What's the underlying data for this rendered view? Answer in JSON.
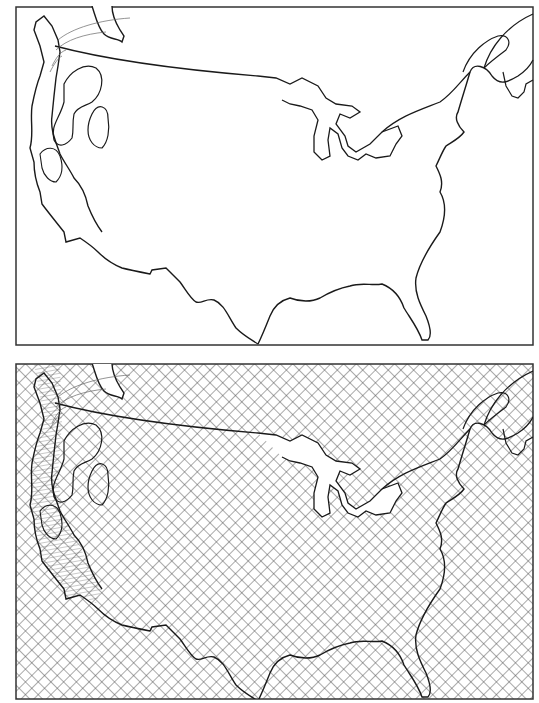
{
  "figure": {
    "type": "paired maps",
    "region": "contiguous United States and southern Canada",
    "line_color": "#1a1a1a",
    "frame_color": "#333333",
    "background": "#ffffff",
    "hatch_color": "#555555"
  },
  "panels": [
    {
      "id": "top",
      "fill": "none",
      "features": [
        "coastline",
        "US-Canada border",
        "Great Lakes",
        "Hudson Bay edge",
        "Gulf of St. Lawrence",
        "western contour regions with tick marks"
      ]
    },
    {
      "id": "bottom",
      "fill": "cross-hatched",
      "features": [
        "coastline",
        "US-Canada border",
        "Great Lakes",
        "Hudson Bay edge",
        "Gulf of St. Lawrence",
        "western contour regions with fine line shading"
      ]
    }
  ]
}
